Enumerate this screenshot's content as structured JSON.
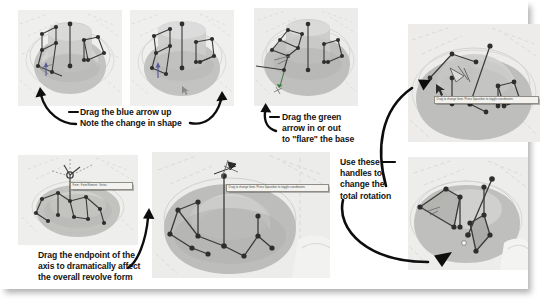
{
  "page": {
    "kind": "instructional-figure",
    "background_color": "#ffffff",
    "sheet_color": "#ffffff"
  },
  "palette": {
    "viewport_bg": "#efefee",
    "viewport_bg_alt": "#ececeb",
    "surface_light": "#d9d9d7",
    "surface_mid": "#c3c3c1",
    "surface_dark": "#ababa9",
    "surface_darker": "#9a9a98",
    "wire_line": "#3a3a3a",
    "vertex_fill": "#2e2e2e",
    "grid_line": "#c9c9c7",
    "callout_text": "#141414",
    "tooltip_bg": "#f3f2ee",
    "tooltip_border": "#8e8d88",
    "tooltip_text": "#4a4a48",
    "arrow_color": "#0d0d0d"
  },
  "panels": [
    {
      "id": "panel-1",
      "name": "revolve-form-default",
      "x": 18,
      "y": 10,
      "w": 104,
      "h": 96,
      "tooltips": []
    },
    {
      "id": "panel-2",
      "name": "revolve-form-blue-arrow-dragged",
      "x": 130,
      "y": 10,
      "w": 104,
      "h": 96,
      "tooltips": []
    },
    {
      "id": "panel-3",
      "name": "revolve-form-green-arrow-flare",
      "x": 254,
      "y": 8,
      "w": 104,
      "h": 98,
      "tooltips": []
    },
    {
      "id": "panel-4",
      "name": "revolve-form-axis-endpoint",
      "x": 18,
      "y": 155,
      "w": 120,
      "h": 90,
      "tooltips": [
        {
          "id": "tooltip-form-element-vertex",
          "name": "tooltip-form-element-vertex",
          "text": "Form : Form Element : Vertex",
          "x": 52,
          "y": 27,
          "w": 58
        }
      ]
    },
    {
      "id": "panel-5",
      "name": "revolve-form-drag-change-form",
      "x": 152,
      "y": 152,
      "w": 178,
      "h": 126,
      "tooltips": [
        {
          "id": "tooltip-drag-change-form-1",
          "name": "tooltip-drag-change-form",
          "text": "Drag to change form. Press Spacebar to toggle coordinates.",
          "x": 74,
          "y": 32,
          "w": 98
        }
      ]
    },
    {
      "id": "panel-6",
      "name": "revolve-form-handles-top-right",
      "x": 408,
      "y": 24,
      "w": 132,
      "h": 118,
      "tooltips": [
        {
          "id": "tooltip-drag-change-form-2",
          "name": "tooltip-drag-change-form",
          "text": "Drag to change form. Press Spacebar to toggle coordinates.",
          "x": 26,
          "y": 72,
          "w": 100
        }
      ]
    },
    {
      "id": "panel-7",
      "name": "revolve-form-total-rotation-handles",
      "x": 408,
      "y": 157,
      "w": 120,
      "h": 113,
      "tooltips": []
    }
  ],
  "callouts": [
    {
      "id": "callout-blue-arrow",
      "name": "callout-drag-blue-arrow",
      "text": "Drag the blue arrow up\nNote the change in shape",
      "x": 80,
      "y": 108
    },
    {
      "id": "callout-green-arrow",
      "name": "callout-drag-green-arrow",
      "text": "Drag the green\narrow in or out\nto \"flare\" the base",
      "x": 281,
      "y": 113
    },
    {
      "id": "callout-axis-endpoint",
      "name": "callout-drag-axis-endpoint",
      "text": "Drag the endpoint of the\naxis to dramatically affect\nthe overall revolve form",
      "x": 38,
      "y": 252
    },
    {
      "id": "callout-rotation-handles",
      "name": "callout-use-handles-rotation",
      "text": "Use these\nhandles to\nchange the\ntotal rotation",
      "x": 339,
      "y": 158
    }
  ],
  "arrows": [
    {
      "id": "arrow-1",
      "name": "arrow-to-blue-handle",
      "from": [
        78,
        126
      ],
      "to": [
        40,
        88
      ]
    },
    {
      "id": "arrow-2",
      "name": "arrow-to-shape-change",
      "from": [
        205,
        122
      ],
      "to": [
        222,
        92
      ]
    },
    {
      "id": "arrow-3",
      "name": "arrow-to-green-handle",
      "from": [
        273,
        131
      ],
      "to": [
        266,
        103
      ]
    },
    {
      "id": "arrow-4",
      "name": "arrow-to-top-right-panel",
      "from": [
        388,
        160
      ],
      "to": [
        432,
        83
      ]
    },
    {
      "id": "arrow-5",
      "name": "arrow-to-rotation-handles",
      "from": [
        344,
        202
      ],
      "to": [
        455,
        255
      ]
    },
    {
      "id": "arrow-6",
      "name": "arrow-to-axis-endpoint",
      "from": [
        130,
        265
      ],
      "to": [
        150,
        210
      ]
    }
  ],
  "leader_lines": [
    {
      "id": "leader-1",
      "name": "leader-blue-arrow",
      "x": 69,
      "y": 112,
      "w": 9
    },
    {
      "id": "leader-2",
      "name": "leader-shape-change",
      "x": 189,
      "y": 124,
      "w": 12
    },
    {
      "id": "leader-3",
      "name": "leader-green-arrow",
      "x": 270,
      "y": 117,
      "w": 9
    },
    {
      "id": "leader-4",
      "name": "leader-rotation-handles",
      "x": 383,
      "y": 162,
      "w": 12
    }
  ]
}
